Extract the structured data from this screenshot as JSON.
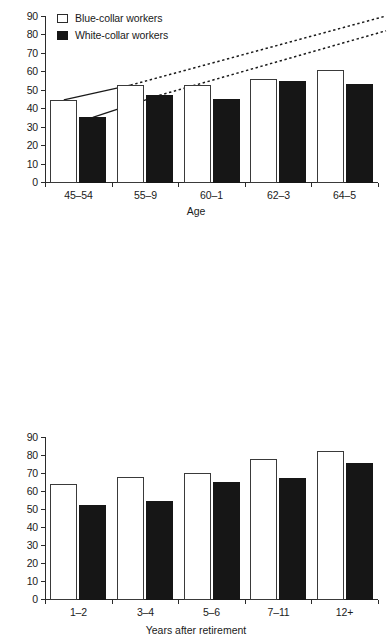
{
  "legend": {
    "items": [
      {
        "label": "Blue-collar workers",
        "style": "open",
        "swatch_name": "legend-swatch-blue-collar"
      },
      {
        "label": "White-collar workers",
        "style": "filled",
        "swatch_name": "legend-swatch-white-collar"
      }
    ]
  },
  "colors": {
    "open_fill": "#ffffff",
    "open_stroke": "#3a3a3a",
    "filled_fill": "#161616",
    "axis": "#2b2b2b",
    "background": "#ffffff"
  },
  "chart_data": [
    {
      "type": "bar",
      "id": "age-chart",
      "title": "",
      "xlabel": "Age",
      "ylabel": "",
      "categories": [
        "45–54",
        "55–9",
        "60–1",
        "62–3",
        "64–5"
      ],
      "yticks": [
        0,
        10,
        20,
        30,
        40,
        50,
        60,
        70,
        80,
        90
      ],
      "ylim": [
        0,
        90
      ],
      "grid": false,
      "legend_position": "top-left",
      "series": [
        {
          "name": "Blue-collar workers",
          "style": "open",
          "values": [
            44.5,
            52.5,
            52.5,
            56.0,
            60.5
          ]
        },
        {
          "name": "White-collar workers",
          "style": "filled",
          "values": [
            35.0,
            47.0,
            45.0,
            54.5,
            53.0
          ]
        }
      ],
      "trend_lines": [
        {
          "name": "Blue-collar trend",
          "solid_from_category": "45–54",
          "solid_to_category": "55–9",
          "start_value": 44.5,
          "mid_value": 52.5,
          "end_value": 90.0,
          "dashed_extension": true
        },
        {
          "name": "White-collar trend",
          "solid_from_category": "45–54",
          "solid_to_category": "55–9",
          "start_value": 35.0,
          "mid_value": 47.0,
          "end_value": 82.0,
          "dashed_extension": true
        }
      ]
    },
    {
      "type": "bar",
      "id": "years-after-retirement-chart",
      "title": "",
      "xlabel": "Years after retirement",
      "ylabel": "",
      "categories": [
        "1–2",
        "3–4",
        "5–6",
        "7–11",
        "12+"
      ],
      "yticks": [
        0,
        10,
        20,
        30,
        40,
        50,
        60,
        70,
        80,
        90
      ],
      "ylim": [
        0,
        90
      ],
      "grid": false,
      "legend_position": "none",
      "series": [
        {
          "name": "Blue-collar workers",
          "style": "open",
          "values": [
            64.0,
            68.0,
            70.0,
            78.0,
            82.5
          ]
        },
        {
          "name": "White-collar workers",
          "style": "filled",
          "values": [
            52.0,
            54.5,
            65.0,
            67.5,
            75.5
          ]
        }
      ],
      "trend_lines": []
    }
  ]
}
